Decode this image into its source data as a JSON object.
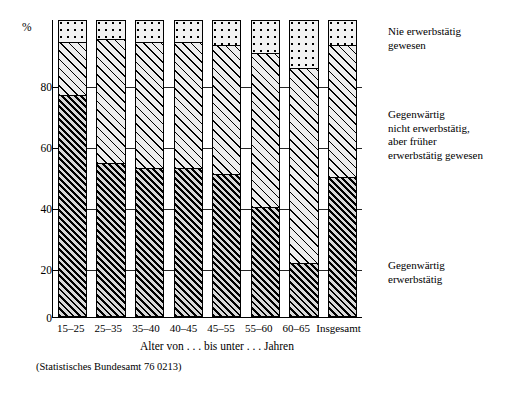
{
  "chart_data": {
    "type": "bar",
    "subtype": "stacked-percentage",
    "title": "",
    "xlabel": "Alter von . . . bis unter . . . Jahren",
    "ylabel": "%",
    "ylim": [
      0,
      100
    ],
    "yticks": [
      0,
      20,
      40,
      60,
      80
    ],
    "ytick_labels": [
      "0",
      "20",
      "40",
      "60",
      "80"
    ],
    "y_unit": "%",
    "grid": true,
    "legend_position": "right",
    "categories": [
      "15–25",
      "25–35",
      "35–40",
      "40–45",
      "45–55",
      "55–60",
      "60–65",
      "Insgesamt"
    ],
    "series": [
      {
        "name": "Gegenwärtig erwerbstätig",
        "pattern": "dark-hatch",
        "values": [
          75,
          52,
          50,
          50,
          48,
          37,
          18,
          47
        ]
      },
      {
        "name": "Gegenwärtig nicht erwerbstätig, aber früher erwerbstätig gewesen",
        "pattern": "light-hatch",
        "values": [
          18,
          42,
          43,
          43,
          44,
          52,
          66,
          45
        ]
      },
      {
        "name": "Nie erwerbstätig gewesen",
        "pattern": "dots",
        "values": [
          7,
          6,
          7,
          7,
          8,
          11,
          16,
          8
        ]
      }
    ],
    "source_note": "(Statistisches Bundesamt 76 0213)"
  },
  "legend": {
    "entries": [
      {
        "line1": "Nie erwerbstätig",
        "line2": "gewesen",
        "line3": "",
        "line4": ""
      },
      {
        "line1": "Gegenwärtig",
        "line2": "nicht erwerbstätig,",
        "line3": "aber früher",
        "line4": "erwerbstätig gewesen"
      },
      {
        "line1": "Gegenwärtig",
        "line2": "erwerbstätig",
        "line3": "",
        "line4": ""
      }
    ]
  },
  "axis": {
    "y_unit": "%",
    "y_labels": [
      "80",
      "60",
      "40",
      "20",
      "0"
    ],
    "x_title": "Alter von . . . bis unter . . . Jahren",
    "x_labels": [
      "15–25",
      "25–35",
      "35–40",
      "40–45",
      "45–55",
      "55–60",
      "60–65",
      "Insgesamt"
    ]
  },
  "footer": {
    "source": "(Statistisches Bundesamt 76 0213)"
  },
  "colors": {
    "ink": "#000000",
    "dots_bg": "#f2f2f2",
    "light_hatch_bg": "#ededed",
    "dark_hatch_bg": "#d8d8d8",
    "page_bg": "#ffffff"
  }
}
